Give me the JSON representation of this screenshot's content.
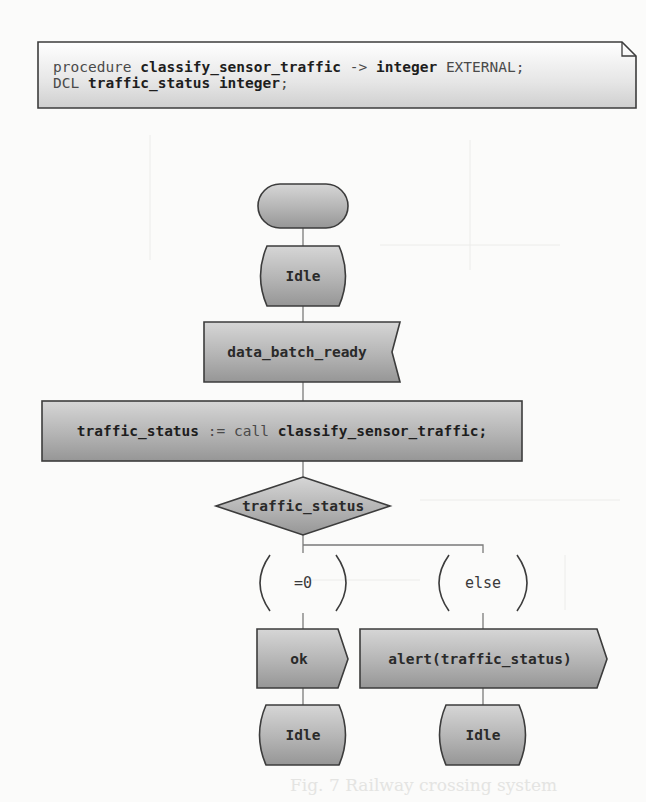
{
  "diagram": {
    "type": "SDL state machine",
    "text_box": {
      "line1": {
        "kw_procedure": "procedure",
        "proc_name": "classify_sensor_traffic",
        "arrow": "->",
        "return_type": "integer",
        "kw_external": "EXTERNAL;"
      },
      "line2": {
        "kw_dcl": "DCL",
        "var_decl": "traffic_status integer",
        "semicolon": ";"
      }
    },
    "start": {
      "label": ""
    },
    "state_initial": {
      "label": "Idle"
    },
    "input_signal": {
      "label": "data_batch_ready"
    },
    "task": {
      "lhs": "traffic_status",
      "assign": ":=",
      "kw_call": "call",
      "rhs": "classify_sensor_traffic;"
    },
    "decision": {
      "label": "traffic_status"
    },
    "branches": [
      {
        "answer": "=0",
        "output": "ok",
        "next_state": "Idle"
      },
      {
        "answer": "else",
        "output": "alert(traffic_status)",
        "next_state": "Idle"
      }
    ],
    "colors": {
      "shape_fill_top": "#d2d2d2",
      "shape_fill_bottom": "#9a9a9a",
      "outline": "#3c3c3c",
      "connector": "#7a7a7a",
      "background": "#fbfbfa"
    }
  },
  "ghost_text": {
    "caption": "Fig. 7 Railway crossing system"
  }
}
